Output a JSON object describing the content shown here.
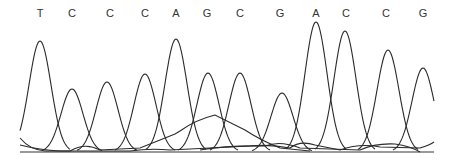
{
  "chart_data": {
    "type": "line",
    "title": "",
    "xlabel": "",
    "ylabel": "",
    "grid": false,
    "legend": null,
    "sequence": [
      "T",
      "C",
      "C",
      "C",
      "A",
      "G",
      "C",
      "G",
      "A",
      "C",
      "C",
      "G"
    ],
    "base_calls": [
      {
        "base": "T",
        "x": 40,
        "peak_height": 111
      },
      {
        "base": "C",
        "x": 72,
        "peak_height": 63
      },
      {
        "base": "C",
        "x": 107,
        "peak_height": 70
      },
      {
        "base": "C",
        "x": 145,
        "peak_height": 78
      },
      {
        "base": "A",
        "x": 176,
        "peak_height": 113
      },
      {
        "base": "G",
        "x": 208,
        "peak_height": 79
      },
      {
        "base": "C",
        "x": 240,
        "peak_height": 79
      },
      {
        "base": "G",
        "x": 282,
        "peak_height": 59
      },
      {
        "base": "A",
        "x": 316,
        "peak_height": 130
      },
      {
        "base": "C",
        "x": 345,
        "peak_height": 121
      },
      {
        "base": "C",
        "x": 388,
        "peak_height": 102
      },
      {
        "base": "G",
        "x": 423,
        "peak_height": 84
      }
    ],
    "baseline_y": 152
  },
  "labels": [
    "T",
    "C",
    "C",
    "C",
    "A",
    "G",
    "C",
    "G",
    "A",
    "C",
    "C",
    "G"
  ],
  "label_x": [
    40,
    72,
    110,
    145,
    176,
    207,
    240,
    280,
    316,
    346,
    386,
    423
  ]
}
